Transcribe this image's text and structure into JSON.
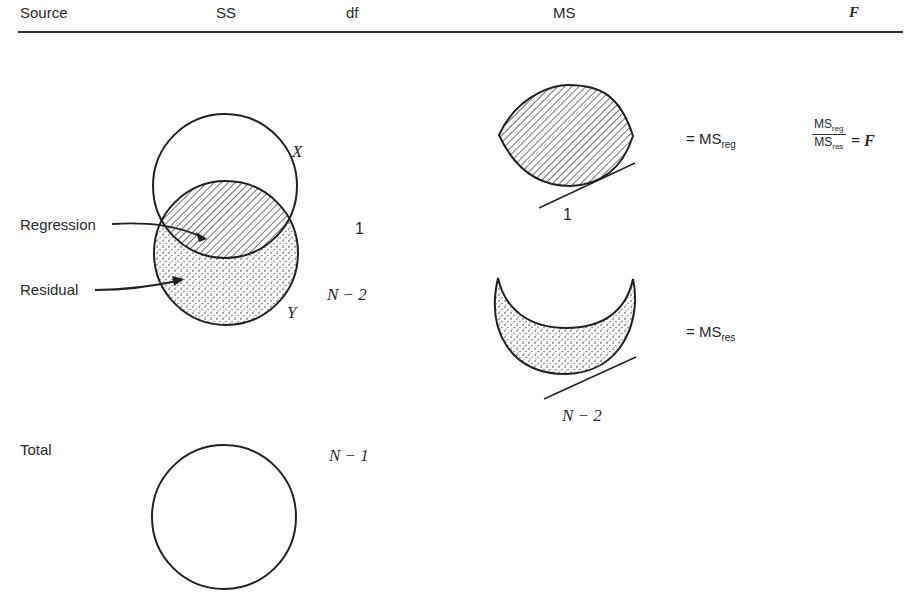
{
  "header": {
    "source": "Source",
    "ss": "SS",
    "df": "df",
    "ms": "MS",
    "f": "F"
  },
  "rows": {
    "regression": {
      "label": "Regression",
      "df": "1"
    },
    "residual": {
      "label": "Residual",
      "df": "N − 2"
    },
    "total": {
      "label": "Total",
      "df": "N − 1"
    }
  },
  "venn": {
    "x_label": "X",
    "y_label": "Y"
  },
  "ms": {
    "reg_divisor": "1",
    "res_divisor": "N − 2",
    "eq_reg_prefix": "= MS",
    "eq_reg_sub": "reg",
    "eq_res_prefix": "= MS",
    "eq_res_sub": "res"
  },
  "f_ratio": {
    "num": "MS",
    "num_sub": "reg",
    "den": "MS",
    "den_sub": "res",
    "result": "= F"
  }
}
